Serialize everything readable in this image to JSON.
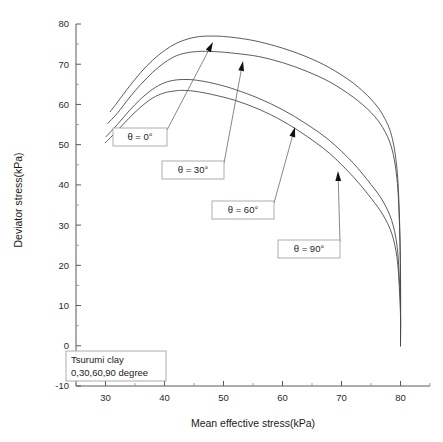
{
  "chart_data": {
    "type": "line",
    "title": "",
    "xlabel": "Mean effective stress(kPa)",
    "ylabel": "Deviator stress(kPa)",
    "xlim": [
      25,
      85
    ],
    "ylim": [
      -10,
      80
    ],
    "xticks": [
      30,
      40,
      50,
      60,
      70,
      80
    ],
    "yticks": [
      -10,
      0,
      10,
      20,
      30,
      40,
      50,
      60,
      70,
      80
    ],
    "xtick_labels": [
      "30",
      "40",
      "50",
      "60",
      "70",
      "80"
    ],
    "ytick_labels": [
      "-10",
      "0",
      "10",
      "20",
      "30",
      "40",
      "50",
      "60",
      "70",
      "80"
    ],
    "grid": false,
    "minor_ticks": true,
    "legend_position": "inline-annotations",
    "caption_lines": [
      "Tsurumi clay",
      "0,30,60,90 degree"
    ],
    "series": [
      {
        "name": "theta = 0",
        "label": "θ = 0°",
        "peak": {
          "x": 48.0,
          "y": 77.0
        },
        "x": [
          30.8,
          32.0,
          34.0,
          36.0,
          38.0,
          40.0,
          42.0,
          44.0,
          46.0,
          48.0,
          50.0,
          53.0,
          56.0,
          60.0,
          64.0,
          68.0,
          72.0,
          75.0,
          77.0,
          78.5,
          79.4,
          79.8,
          80.0,
          80.0
        ],
        "y": [
          58.2,
          60.5,
          64.4,
          68.0,
          71.0,
          73.4,
          75.2,
          76.3,
          76.9,
          77.0,
          76.9,
          76.4,
          75.6,
          74.0,
          71.9,
          69.1,
          65.3,
          61.3,
          57.4,
          52.2,
          44.0,
          33.0,
          18.0,
          0.0
        ]
      },
      {
        "name": "theta = 30",
        "label": "θ = 30°",
        "peak": {
          "x": 47.0,
          "y": 73.2
        },
        "x": [
          30.4,
          32.0,
          34.0,
          36.0,
          38.0,
          40.0,
          42.0,
          44.0,
          46.0,
          47.0,
          49.0,
          52.0,
          56.0,
          60.0,
          64.0,
          68.0,
          72.0,
          75.0,
          77.0,
          78.5,
          79.4,
          79.8,
          80.0,
          80.0
        ],
        "y": [
          55.3,
          57.8,
          61.6,
          65.0,
          68.0,
          70.4,
          72.1,
          72.9,
          73.2,
          73.2,
          73.1,
          72.7,
          71.9,
          70.4,
          68.3,
          65.6,
          61.8,
          58.0,
          54.2,
          49.2,
          41.5,
          31.0,
          17.0,
          0.0
        ]
      },
      {
        "name": "theta = 60",
        "label": "θ = 60°",
        "peak": {
          "x": 44.0,
          "y": 66.2
        },
        "x": [
          30.1,
          32.0,
          34.0,
          36.0,
          38.0,
          40.0,
          42.0,
          44.0,
          46.0,
          49.0,
          52.0,
          56.0,
          60.0,
          64.0,
          68.0,
          72.0,
          75.0,
          77.0,
          78.5,
          79.4,
          79.8,
          80.0,
          80.0
        ],
        "y": [
          52.0,
          55.0,
          58.4,
          61.4,
          63.8,
          65.4,
          66.1,
          66.2,
          65.9,
          65.0,
          63.7,
          61.5,
          58.7,
          55.2,
          51.0,
          45.4,
          40.1,
          36.0,
          31.2,
          25.0,
          17.0,
          9.0,
          0.0
        ]
      },
      {
        "name": "theta = 90",
        "label": "θ = 90°",
        "peak": {
          "x": 43.0,
          "y": 63.5
        },
        "x": [
          30.0,
          32.0,
          34.0,
          36.0,
          38.0,
          40.0,
          42.0,
          43.0,
          45.0,
          48.0,
          52.0,
          56.0,
          60.0,
          64.0,
          68.0,
          72.0,
          75.0,
          77.0,
          78.5,
          79.4,
          79.8,
          80.0,
          80.0
        ],
        "y": [
          50.5,
          53.5,
          56.6,
          59.4,
          61.6,
          62.9,
          63.4,
          63.5,
          63.3,
          62.5,
          61.0,
          58.8,
          55.9,
          52.2,
          47.8,
          42.0,
          36.7,
          32.6,
          28.0,
          22.0,
          14.5,
          7.5,
          0.0
        ]
      }
    ],
    "annotations": [
      {
        "label": "θ = 0°",
        "box": {
          "x": 113,
          "y": 128,
          "w": 54,
          "h": 18
        },
        "leader_from": {
          "x": 167,
          "y": 130
        },
        "leader_to": {
          "x": 213,
          "y": 42
        },
        "arrow_angle_deg": -62
      },
      {
        "label": "θ = 30°",
        "box": {
          "x": 162,
          "y": 161,
          "w": 62,
          "h": 18
        },
        "leader_from": {
          "x": 224,
          "y": 163
        },
        "leader_to": {
          "x": 243,
          "y": 61
        },
        "arrow_angle_deg": -79
      },
      {
        "label": "θ = 60°",
        "box": {
          "x": 212,
          "y": 201,
          "w": 62,
          "h": 18
        },
        "leader_from": {
          "x": 274,
          "y": 203
        },
        "leader_to": {
          "x": 295,
          "y": 127
        },
        "arrow_angle_deg": -74
      },
      {
        "label": "θ = 90°",
        "box": {
          "x": 278,
          "y": 240,
          "w": 62,
          "h": 18
        },
        "leader_from": {
          "x": 340,
          "y": 242
        },
        "leader_to": {
          "x": 338,
          "y": 171
        },
        "arrow_angle_deg": -88
      }
    ],
    "caption_box": {
      "x": 66,
      "y": 351,
      "w": 100,
      "h": 30
    },
    "colors": {
      "curve": "#4a4a4a",
      "axis": "#5a5a5a",
      "text": "#1a1a1a",
      "box_border": "#9a9a9a",
      "background": "#ffffff",
      "arrow": "#111111"
    }
  }
}
